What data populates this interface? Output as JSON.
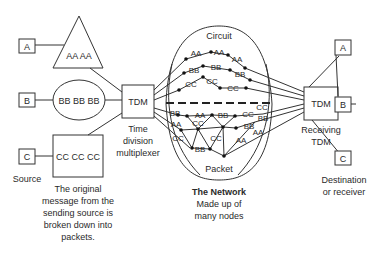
{
  "sources": {
    "a": {
      "label": "A",
      "message": "AA AA",
      "shape": "triangle"
    },
    "b": {
      "label": "B",
      "message": "BB BB BB",
      "shape": "ellipse"
    },
    "c": {
      "label": "C",
      "message": "CC CC CC",
      "shape": "rectangle"
    },
    "caption": "Source"
  },
  "message_note": [
    "The original",
    "message from the",
    "sending source is",
    "broken down into",
    "packets."
  ],
  "sending_tdm": {
    "label": "TDM",
    "caption": [
      "Time",
      "division",
      "multiplexer"
    ]
  },
  "network": {
    "circuit_label": "Circuit",
    "packet_label": "Packet",
    "title": "The Network",
    "subtitle": [
      "Made up of",
      "many nodes"
    ],
    "circuit_paths": [
      {
        "labels": [
          "AA",
          "AA",
          "AA"
        ]
      },
      {
        "labels": [
          "BB",
          "BB",
          "BB"
        ]
      },
      {
        "labels": [
          "CC",
          "CC",
          "CC"
        ]
      }
    ],
    "packet_labels": [
      "BB",
      "AA",
      "BB",
      "CC",
      "AA",
      "CC",
      "BB",
      "CC",
      "BB",
      "CC",
      "AA",
      "CC",
      "BB",
      "AA"
    ]
  },
  "receiving_tdm": {
    "label": "TDM",
    "caption": [
      "Receiving",
      "TDM"
    ]
  },
  "destinations": {
    "a": {
      "label": "A"
    },
    "b": {
      "label": "B"
    },
    "c": {
      "label": "C"
    },
    "caption": [
      "Destination",
      "or receiver"
    ]
  }
}
